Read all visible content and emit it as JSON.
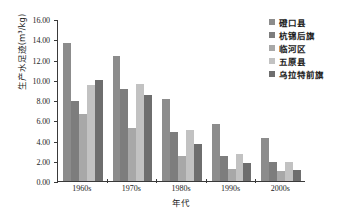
{
  "chart_data": {
    "type": "bar",
    "title": "",
    "xlabel": "年代",
    "ylabel": "生产水足迹(m³/kg)",
    "categories": [
      "1960s",
      "1970s",
      "1980s",
      "1990s",
      "2000s"
    ],
    "ylim": [
      0.0,
      16.0
    ],
    "ytick_step": 2.0,
    "yticks": [
      "0.00",
      "2.00",
      "4.00",
      "6.00",
      "8.00",
      "10.00",
      "12.00",
      "14.00",
      "16.00"
    ],
    "grid": false,
    "legend_position": "top-right",
    "series": [
      {
        "name": "磴口县",
        "color": "#8c8c8c",
        "values": [
          13.6,
          12.3,
          8.1,
          5.65,
          4.25
        ]
      },
      {
        "name": "杭锦后旗",
        "color": "#7d7d7d",
        "values": [
          7.9,
          9.1,
          4.8,
          2.45,
          1.85
        ]
      },
      {
        "name": "临河区",
        "color": "#a8a8a8",
        "values": [
          6.6,
          5.2,
          2.45,
          1.2,
          0.95
        ]
      },
      {
        "name": "五原县",
        "color": "#c2c2c2",
        "values": [
          9.5,
          9.6,
          5.05,
          2.65,
          1.85
        ]
      },
      {
        "name": "乌拉特前旗",
        "color": "#6e6e6e",
        "values": [
          10.0,
          8.5,
          3.7,
          1.75,
          1.1
        ]
      }
    ]
  },
  "axes": {
    "axis_color": "#3a3a3a",
    "text_color": "#1c1c1c"
  }
}
